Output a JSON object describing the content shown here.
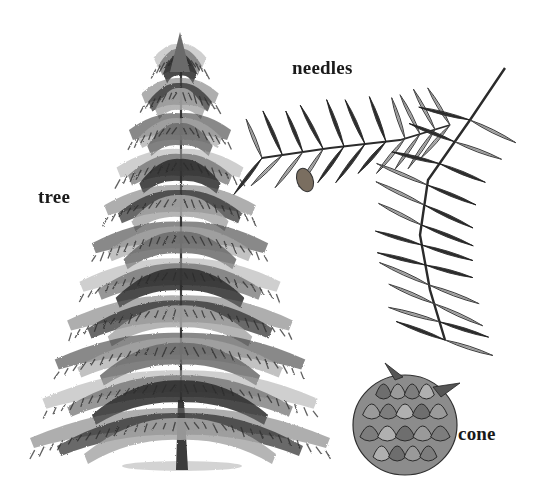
{
  "diagram": {
    "background": "#ffffff",
    "ink_dark": "#2b2b2b",
    "ink_mid": "#6b6b6b",
    "ink_light": "#a8a8a8",
    "labels": [
      {
        "id": "tree",
        "text": "tree",
        "x": 38,
        "y": 187
      },
      {
        "id": "needles",
        "text": "needles",
        "x": 292,
        "y": 58
      },
      {
        "id": "cone",
        "text": "cone",
        "x": 458,
        "y": 424
      }
    ],
    "parts": {
      "tree": {
        "trunk_x": 180,
        "top_y": 32,
        "base_y": 468,
        "base_half_width": 150,
        "tiers": 11
      },
      "needles": {
        "main_stem": [
          [
            505,
            68
          ],
          [
            470,
            120
          ],
          [
            428,
            180
          ],
          [
            420,
            235
          ],
          [
            430,
            290
          ],
          [
            445,
            340
          ]
        ],
        "side_stem": [
          [
            262,
            158
          ],
          [
            330,
            148
          ],
          [
            400,
            140
          ],
          [
            450,
            125
          ]
        ]
      },
      "cone": {
        "cx": 405,
        "cy": 425,
        "rx": 52,
        "ry": 50
      }
    }
  }
}
